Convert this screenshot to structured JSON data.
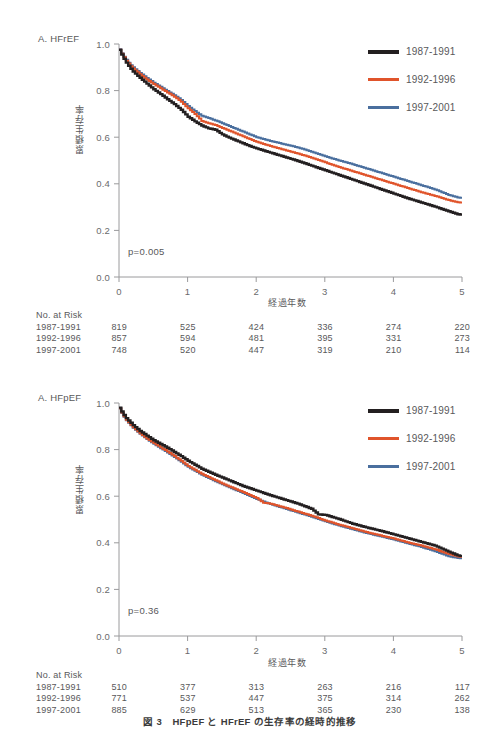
{
  "figure": {
    "caption": "図 3　HFpEF と HFrEF の生存率の経時的推移",
    "colors": {
      "series_1987": "#231f20",
      "series_1992": "#e0542b",
      "series_1997": "#4a6f9e",
      "axis": "#9a9a9c",
      "text": "#58585a"
    }
  },
  "legend": {
    "items": [
      {
        "label": "1987-1991",
        "color": "#231f20",
        "icon": "line-swatch-black"
      },
      {
        "label": "1992-1996",
        "color": "#e0542b",
        "icon": "line-swatch-orange"
      },
      {
        "label": "1997-2001",
        "color": "#4a6f9e",
        "icon": "line-swatch-blue"
      }
    ]
  },
  "panel_a": {
    "label": "A. HFrEF",
    "pvalue": "p=0.005",
    "ylabel": "累積生存率",
    "xlabel": "経過年数",
    "risk_title": "No. at Risk",
    "risk_rows": [
      {
        "label": "1987-1991",
        "values": [
          "819",
          "525",
          "424",
          "336",
          "274",
          "220"
        ]
      },
      {
        "label": "1992-1996",
        "values": [
          "857",
          "594",
          "481",
          "395",
          "331",
          "273"
        ]
      },
      {
        "label": "1997-2001",
        "values": [
          "748",
          "520",
          "447",
          "319",
          "210",
          "114"
        ]
      }
    ]
  },
  "panel_b": {
    "label": "A. HFpEF",
    "pvalue": "p=0.36",
    "ylabel": "累積生存率",
    "xlabel": "経過年数",
    "risk_title": "No. at Risk",
    "risk_rows": [
      {
        "label": "1987-1991",
        "values": [
          "510",
          "377",
          "313",
          "263",
          "216",
          "117"
        ]
      },
      {
        "label": "1992-1996",
        "values": [
          "771",
          "537",
          "447",
          "375",
          "314",
          "262"
        ]
      },
      {
        "label": "1997-2001",
        "values": [
          "885",
          "629",
          "513",
          "365",
          "230",
          "138"
        ]
      }
    ]
  },
  "chart_data": [
    {
      "panel": "A",
      "type": "line",
      "title": "A. HFrEF",
      "xlabel": "経過年数",
      "ylabel": "累積生存率",
      "xlim": [
        0,
        5
      ],
      "ylim": [
        0,
        1.0
      ],
      "xticks": [
        0,
        1,
        2,
        3,
        4,
        5
      ],
      "xtick_labels": [
        "0",
        "1",
        "2",
        "3",
        "4",
        "5"
      ],
      "yticks": [
        0.0,
        0.2,
        0.4,
        0.6,
        0.8,
        1.0
      ],
      "ytick_labels": [
        "0.0",
        "0.2",
        "0.4",
        "0.6",
        "0.8",
        "1.0"
      ],
      "grid": false,
      "legend_position": "top-right",
      "annotations": [
        "p=0.005"
      ],
      "series": [
        {
          "name": "1987-1991",
          "color": "#231f20",
          "x": [
            0.0,
            0.05,
            0.1,
            0.15,
            0.2,
            0.3,
            0.4,
            0.5,
            0.6,
            0.7,
            0.8,
            0.9,
            1.0,
            1.1,
            1.2,
            1.3,
            1.4,
            1.5,
            1.6,
            1.7,
            1.8,
            1.9,
            2.0,
            2.2,
            2.4,
            2.6,
            2.8,
            3.0,
            3.2,
            3.4,
            3.6,
            3.8,
            4.0,
            4.2,
            4.4,
            4.6,
            4.8,
            4.95
          ],
          "y": [
            0.975,
            0.945,
            0.92,
            0.9,
            0.882,
            0.855,
            0.83,
            0.806,
            0.785,
            0.763,
            0.742,
            0.718,
            0.688,
            0.668,
            0.65,
            0.638,
            0.632,
            0.612,
            0.598,
            0.586,
            0.574,
            0.562,
            0.552,
            0.534,
            0.516,
            0.498,
            0.478,
            0.458,
            0.438,
            0.418,
            0.398,
            0.378,
            0.358,
            0.338,
            0.32,
            0.302,
            0.282,
            0.268
          ]
        },
        {
          "name": "1992-1996",
          "color": "#e0542b",
          "x": [
            0.0,
            0.05,
            0.1,
            0.15,
            0.2,
            0.3,
            0.4,
            0.5,
            0.6,
            0.7,
            0.8,
            0.9,
            1.0,
            1.1,
            1.2,
            1.3,
            1.4,
            1.5,
            1.6,
            1.7,
            1.8,
            1.9,
            2.0,
            2.2,
            2.4,
            2.6,
            2.8,
            3.0,
            3.2,
            3.4,
            3.6,
            3.8,
            4.0,
            4.2,
            4.4,
            4.6,
            4.8,
            4.95
          ],
          "y": [
            0.975,
            0.95,
            0.928,
            0.91,
            0.895,
            0.87,
            0.848,
            0.828,
            0.81,
            0.792,
            0.774,
            0.752,
            0.724,
            0.7,
            0.67,
            0.66,
            0.652,
            0.64,
            0.628,
            0.616,
            0.604,
            0.592,
            0.58,
            0.562,
            0.546,
            0.53,
            0.512,
            0.492,
            0.472,
            0.454,
            0.436,
            0.418,
            0.4,
            0.382,
            0.364,
            0.348,
            0.33,
            0.32
          ]
        },
        {
          "name": "1997-2001",
          "color": "#4a6f9e",
          "x": [
            0.0,
            0.05,
            0.1,
            0.15,
            0.2,
            0.3,
            0.4,
            0.5,
            0.6,
            0.7,
            0.8,
            0.9,
            1.0,
            1.1,
            1.2,
            1.3,
            1.4,
            1.5,
            1.6,
            1.7,
            1.8,
            1.9,
            2.0,
            2.2,
            2.4,
            2.6,
            2.8,
            3.0,
            3.2,
            3.4,
            3.6,
            3.8,
            4.0,
            4.2,
            4.4,
            4.6,
            4.8,
            4.95
          ],
          "y": [
            0.978,
            0.952,
            0.932,
            0.914,
            0.9,
            0.876,
            0.854,
            0.834,
            0.816,
            0.798,
            0.78,
            0.76,
            0.734,
            0.712,
            0.692,
            0.682,
            0.672,
            0.66,
            0.648,
            0.636,
            0.624,
            0.612,
            0.6,
            0.584,
            0.57,
            0.556,
            0.538,
            0.518,
            0.5,
            0.484,
            0.466,
            0.448,
            0.43,
            0.412,
            0.394,
            0.376,
            0.352,
            0.34
          ]
        }
      ]
    },
    {
      "panel": "B",
      "type": "line",
      "title": "A. HFpEF",
      "xlabel": "経過年数",
      "ylabel": "累積生存率",
      "xlim": [
        0,
        5
      ],
      "ylim": [
        0,
        1.0
      ],
      "xticks": [
        0,
        1,
        2,
        3,
        4,
        5
      ],
      "xtick_labels": [
        "0",
        "1",
        "2",
        "3",
        "4",
        "5"
      ],
      "yticks": [
        0.0,
        0.2,
        0.4,
        0.6,
        0.8,
        1.0
      ],
      "ytick_labels": [
        "0.0",
        "0.2",
        "0.4",
        "0.6",
        "0.8",
        "1.0"
      ],
      "grid": false,
      "legend_position": "top-right",
      "annotations": [
        "p=0.36"
      ],
      "series": [
        {
          "name": "1987-1991",
          "color": "#231f20",
          "x": [
            0.0,
            0.05,
            0.1,
            0.2,
            0.3,
            0.4,
            0.5,
            0.6,
            0.7,
            0.8,
            0.9,
            1.0,
            1.2,
            1.4,
            1.6,
            1.8,
            2.0,
            2.2,
            2.4,
            2.6,
            2.8,
            2.9,
            3.0,
            3.2,
            3.4,
            3.6,
            3.8,
            4.0,
            4.2,
            4.4,
            4.6,
            4.8,
            4.95
          ],
          "y": [
            0.98,
            0.955,
            0.935,
            0.905,
            0.88,
            0.86,
            0.84,
            0.824,
            0.808,
            0.79,
            0.772,
            0.752,
            0.718,
            0.692,
            0.668,
            0.644,
            0.624,
            0.604,
            0.586,
            0.568,
            0.546,
            0.522,
            0.52,
            0.502,
            0.482,
            0.466,
            0.452,
            0.436,
            0.42,
            0.404,
            0.388,
            0.362,
            0.344
          ]
        },
        {
          "name": "1992-1996",
          "color": "#e0542b",
          "x": [
            0.0,
            0.05,
            0.1,
            0.2,
            0.3,
            0.4,
            0.5,
            0.6,
            0.7,
            0.8,
            0.9,
            1.0,
            1.2,
            1.4,
            1.6,
            1.8,
            2.0,
            2.1,
            2.2,
            2.4,
            2.6,
            2.8,
            3.0,
            3.2,
            3.4,
            3.6,
            3.8,
            4.0,
            4.2,
            4.4,
            4.6,
            4.8,
            4.95
          ],
          "y": [
            0.978,
            0.95,
            0.928,
            0.896,
            0.87,
            0.848,
            0.828,
            0.81,
            0.792,
            0.772,
            0.752,
            0.73,
            0.696,
            0.668,
            0.642,
            0.618,
            0.592,
            0.572,
            0.568,
            0.552,
            0.534,
            0.516,
            0.496,
            0.478,
            0.462,
            0.446,
            0.432,
            0.418,
            0.402,
            0.388,
            0.372,
            0.352,
            0.34
          ]
        },
        {
          "name": "1997-2001",
          "color": "#4a6f9e",
          "x": [
            0.0,
            0.05,
            0.1,
            0.2,
            0.3,
            0.4,
            0.5,
            0.6,
            0.7,
            0.8,
            0.9,
            1.0,
            1.2,
            1.4,
            1.6,
            1.8,
            2.0,
            2.2,
            2.4,
            2.6,
            2.8,
            3.0,
            3.2,
            3.4,
            3.6,
            3.8,
            4.0,
            4.2,
            4.4,
            4.6,
            4.8,
            4.95
          ],
          "y": [
            0.976,
            0.948,
            0.926,
            0.894,
            0.868,
            0.845,
            0.825,
            0.806,
            0.788,
            0.768,
            0.748,
            0.726,
            0.692,
            0.664,
            0.638,
            0.614,
            0.588,
            0.566,
            0.548,
            0.53,
            0.512,
            0.492,
            0.474,
            0.458,
            0.442,
            0.428,
            0.414,
            0.398,
            0.382,
            0.364,
            0.342,
            0.334
          ]
        }
      ]
    }
  ]
}
